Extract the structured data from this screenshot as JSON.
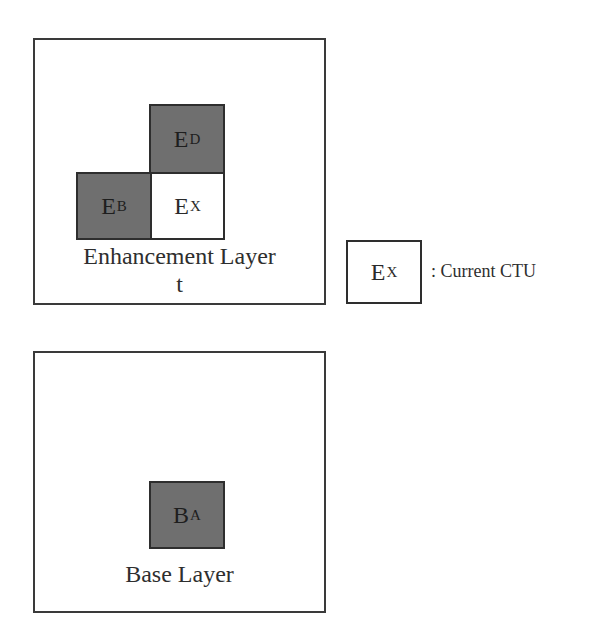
{
  "enhancement_layer": {
    "label_line1": "Enhancement Layer",
    "label_line2": "t",
    "cells": [
      {
        "id": "E_D",
        "main": "E",
        "sub": "D",
        "fill": "#6f6f6f"
      },
      {
        "id": "E_B",
        "main": "E",
        "sub": "B",
        "fill": "#6f6f6f"
      },
      {
        "id": "E_X",
        "main": "E",
        "sub": "X",
        "fill": "#ffffff"
      }
    ]
  },
  "base_layer": {
    "label": "Base Layer",
    "cells": [
      {
        "id": "B_A",
        "main": "B",
        "sub": "A",
        "fill": "#6f6f6f"
      }
    ]
  },
  "legend": {
    "cell": {
      "main": "E",
      "sub": "X"
    },
    "text": ": Current CTU"
  }
}
